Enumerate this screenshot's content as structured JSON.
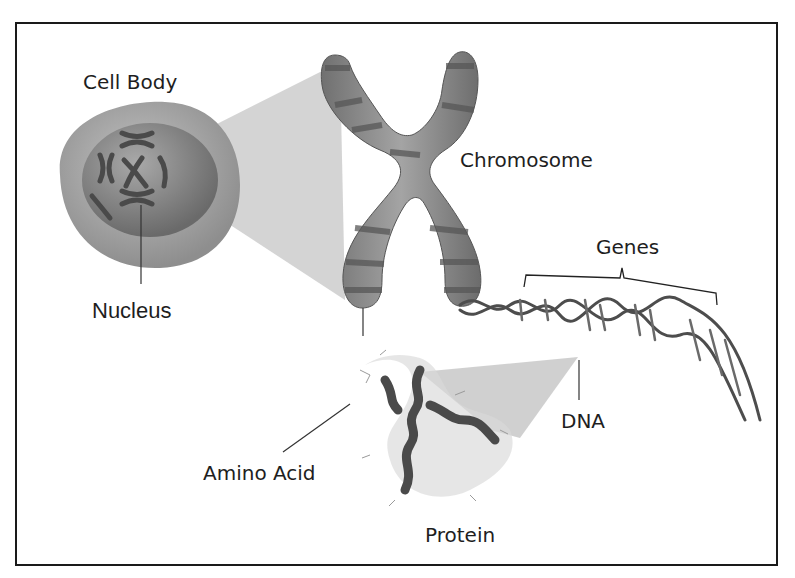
{
  "diagram": {
    "type": "biology-illustration",
    "labels": {
      "cell_body": "Cell Body",
      "nucleus": "Nucleus",
      "chromosome": "Chromosome",
      "genes": "Genes",
      "dna": "DNA",
      "amino_acid": "Amino Acid",
      "protein": "Protein"
    },
    "colors": {
      "frame": "#1a1a1a",
      "cell_outer": "#a8a8a8",
      "nucleus": "#8a8a8a",
      "chromosome_body": "#8c8c8c",
      "chromosome_band": "#5a5a5a",
      "zoom_cone": "#c8c8c8",
      "text": "#1e1e1e"
    }
  }
}
